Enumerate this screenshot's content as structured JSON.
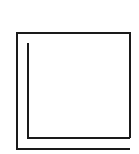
{
  "figure": {
    "type": "line-drawing",
    "stroke_color": "#1a1a1a",
    "background_color": "#ffffff",
    "stroke_width": 2
  },
  "shapes": {
    "outer_frame": {
      "points": "130,138 130,33 17,33 17,149 130,149"
    },
    "inner_corner": {
      "points": "28,43 28,138 130,138"
    }
  }
}
